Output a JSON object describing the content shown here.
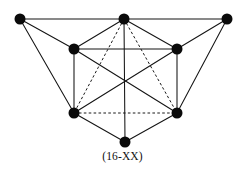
{
  "figure": {
    "caption": "(16-XX)",
    "background_color": "#ffffff",
    "line_color": "#141414",
    "vertex_color": "#0a0a0a",
    "width": 245,
    "height": 175
  },
  "chart_data": {
    "type": "diagram",
    "subtype": "undirected-graph",
    "title": "(16-XX)",
    "vertex_count": 8,
    "edge_count": 19,
    "vertex_radius": 5.5,
    "vertices": [
      {
        "id": "TL",
        "label": "top-left",
        "x": 20,
        "y": 19
      },
      {
        "id": "TC",
        "label": "top-center",
        "x": 124,
        "y": 19
      },
      {
        "id": "TR",
        "label": "top-right",
        "x": 227,
        "y": 19
      },
      {
        "id": "ML",
        "label": "middle-left",
        "x": 74,
        "y": 49
      },
      {
        "id": "MR",
        "label": "middle-right",
        "x": 177,
        "y": 49
      },
      {
        "id": "BL",
        "label": "lower-left",
        "x": 74,
        "y": 113
      },
      {
        "id": "BR",
        "label": "lower-right",
        "x": 177,
        "y": 113
      },
      {
        "id": "BC",
        "label": "bottom-center",
        "x": 125,
        "y": 142
      }
    ],
    "edges": [
      {
        "from": "TL",
        "to": "TC",
        "style": "solid"
      },
      {
        "from": "TC",
        "to": "TR",
        "style": "solid"
      },
      {
        "from": "TL",
        "to": "ML",
        "style": "solid"
      },
      {
        "from": "TL",
        "to": "BL",
        "style": "solid"
      },
      {
        "from": "TC",
        "to": "ML",
        "style": "solid"
      },
      {
        "from": "TC",
        "to": "MR",
        "style": "solid"
      },
      {
        "from": "TR",
        "to": "MR",
        "style": "solid"
      },
      {
        "from": "TR",
        "to": "BR",
        "style": "solid"
      },
      {
        "from": "ML",
        "to": "MR",
        "style": "solid"
      },
      {
        "from": "ML",
        "to": "BL",
        "style": "solid"
      },
      {
        "from": "MR",
        "to": "BR",
        "style": "solid"
      },
      {
        "from": "ML",
        "to": "BR",
        "style": "solid"
      },
      {
        "from": "MR",
        "to": "BL",
        "style": "solid"
      },
      {
        "from": "BL",
        "to": "BC",
        "style": "solid"
      },
      {
        "from": "BR",
        "to": "BC",
        "style": "solid"
      },
      {
        "from": "TC",
        "to": "BC",
        "style": "solid"
      },
      {
        "from": "TC",
        "to": "BL",
        "style": "dashed"
      },
      {
        "from": "TC",
        "to": "BR",
        "style": "dashed"
      },
      {
        "from": "BL",
        "to": "BR",
        "style": "dashed"
      }
    ]
  }
}
